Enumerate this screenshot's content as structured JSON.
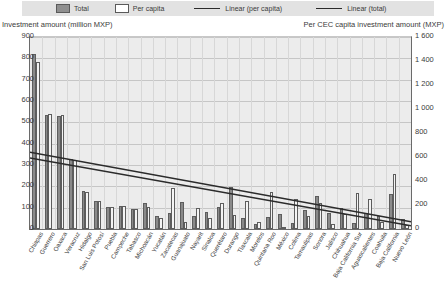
{
  "legend": {
    "items": [
      {
        "name": "total-swatch",
        "label": "Total",
        "marker": "filled-square",
        "color": "#8f8f8f"
      },
      {
        "name": "per-capita-swatch",
        "label": "Per capita",
        "marker": "hollow-square",
        "color": "#ffffff"
      },
      {
        "name": "linear-per-capita-line",
        "label": "Linear (per capita)",
        "marker": "line",
        "color": "#2b2b2b"
      },
      {
        "name": "linear-total-line",
        "label": "Linear (total)",
        "marker": "line",
        "color": "#2b2b2b"
      }
    ]
  },
  "axes": {
    "left_title": "Investment amount (million MXP)",
    "right_title": "Per CEC capita investment amount (MXP)",
    "left_ticks": [
      "900",
      "800",
      "700",
      "600",
      "500",
      "400",
      "300",
      "200",
      "100",
      "0"
    ],
    "right_ticks": [
      "1 600",
      "1 400",
      "1 200",
      "1 000",
      "800",
      "600",
      "400",
      "200",
      "0"
    ]
  },
  "chart_data": {
    "type": "bar",
    "title": "",
    "xlabel": "",
    "ylabel": "Investment amount (million MXP)",
    "y2label": "Per CEC capita investment amount (MXP)",
    "ylim": [
      0,
      900
    ],
    "y2lim": [
      0,
      1600
    ],
    "grid": true,
    "legend_position": "top",
    "categories": [
      "Chiapas",
      "Guerrero",
      "Oaxaca",
      "Veracruz",
      "Hidalgo",
      "San Luis Potosí",
      "Puebla",
      "Campeche",
      "Tabasco",
      "Michoacán",
      "Yucatán",
      "Zacatecas",
      "Guanajuato",
      "Nayarit",
      "Sinaloa",
      "Querétaro",
      "Durango",
      "Tlaxcala",
      "Morelos",
      "Quintana Roo",
      "México",
      "Colima",
      "Tamaulipas",
      "Sonora",
      "Jalisco",
      "Chihuahua",
      "Baja California Sur",
      "Aguascalientes",
      "Coahuila",
      "Baja California",
      "Nuevo León"
    ],
    "series": [
      {
        "name": "Total",
        "axis": "left",
        "unit": "million MXP",
        "color": "#8a8a8a",
        "values": [
          820,
          535,
          528,
          330,
          180,
          130,
          105,
          110,
          95,
          120,
          60,
          75,
          125,
          60,
          80,
          105,
          195,
          50,
          25,
          55,
          70,
          30,
          90,
          155,
          75,
          100,
          30,
          75,
          60,
          165,
          45
        ]
      },
      {
        "name": "Per capita",
        "axis": "right",
        "unit": "MXP",
        "color": "#f4f4f4",
        "values": [
          1395,
          960,
          950,
          575,
          310,
          235,
          185,
          195,
          165,
          180,
          95,
          340,
          60,
          175,
          95,
          215,
          120,
          235,
          60,
          305,
          20,
          250,
          105,
          220,
          40,
          125,
          300,
          250,
          55,
          460,
          35
        ]
      }
    ],
    "trendlines": [
      {
        "name": "Linear (per capita)",
        "axis": "right",
        "color": "#2b2b2b",
        "start_value": 640,
        "end_value": 60
      },
      {
        "name": "Linear (total)",
        "axis": "left",
        "color": "#2b2b2b",
        "start_value": 333,
        "end_value": 15
      }
    ]
  }
}
